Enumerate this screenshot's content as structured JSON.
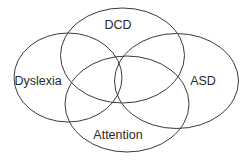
{
  "diagram": {
    "type": "venn",
    "sets": [
      {
        "id": "dcd",
        "label": "DCD"
      },
      {
        "id": "dyslexia",
        "label": "Dyslexia"
      },
      {
        "id": "asd",
        "label": "ASD"
      },
      {
        "id": "attention",
        "label": "Attention"
      }
    ],
    "stroke_color": "#3a3a3a",
    "text_color": "#2a2a2a",
    "background": "#ffffff"
  }
}
